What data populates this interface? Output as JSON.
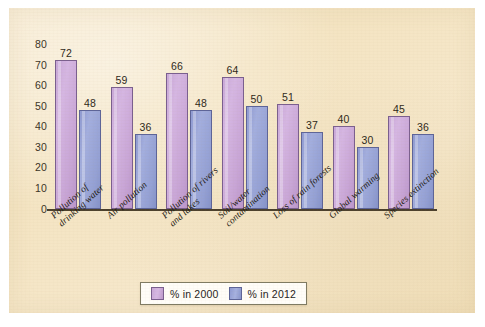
{
  "chart_data": {
    "type": "bar",
    "title": "",
    "subtitle": "",
    "xlabel": "",
    "ylabel": "",
    "ylim": [
      0,
      80
    ],
    "yticks": [
      "0",
      "10",
      "20",
      "30",
      "40",
      "50",
      "60",
      "70",
      "80"
    ],
    "ytick_values": [
      0,
      10,
      20,
      30,
      40,
      50,
      60,
      70,
      80
    ],
    "grid": false,
    "legend_position": "bottom-center",
    "categories": [
      "Pollution of drinking water",
      "Air pollution",
      "Pollution of rivers and lakes",
      "Soil/water contamination",
      "Loss of rain forests",
      "Global warming",
      "Species extinction"
    ],
    "category_lines": [
      [
        "Pollution of",
        "drinking water"
      ],
      [
        "Air pollution",
        ""
      ],
      [
        "Pollution of rivers",
        "and lakes"
      ],
      [
        "Soil/water",
        "contamination"
      ],
      [
        "Loss of rain forests",
        ""
      ],
      [
        "Global warming",
        ""
      ],
      [
        "Species extinction",
        ""
      ]
    ],
    "series": [
      {
        "name": "% in 2000",
        "color": "#cba9da",
        "values": [
          72,
          59,
          66,
          64,
          51,
          40,
          45
        ]
      },
      {
        "name": "% in 2012",
        "color": "#98a3d6",
        "values": [
          48,
          36,
          48,
          50,
          37,
          30,
          36
        ]
      }
    ]
  },
  "legend": {
    "items": [
      {
        "label": "% in 2000",
        "swatch": "purple"
      },
      {
        "label": "% in 2012",
        "swatch": "blue"
      }
    ]
  },
  "colors": {
    "paper_background": "#f4e4c2",
    "page_background": "#ffffff",
    "axis": "#4a3f2c",
    "series_2000": "#cba9da",
    "series_2000_border": "#7a5f8e",
    "series_2012": "#98a3d6",
    "series_2012_border": "#5d6498",
    "text": "#2e2819",
    "legend_background": "#fffdf8",
    "legend_border": "#7e7a62"
  }
}
